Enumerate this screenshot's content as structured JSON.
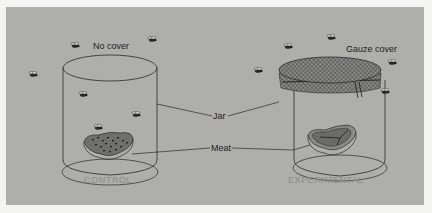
{
  "figure": {
    "background_color": "#aeaeab",
    "border_color": "#f4f4f2",
    "line_color": "#2a2a2a"
  },
  "left_jar": {
    "cover_label": "No cover",
    "caption": "CONTROL",
    "meat_state": "maggots"
  },
  "right_jar": {
    "cover_label": "Gauze cover",
    "caption": "EXPERIMENTAL",
    "meat_state": "clean"
  },
  "callouts": {
    "jar": "Jar",
    "meat": "Meat"
  },
  "icons": {
    "fly": "fly-icon"
  },
  "caption_color": "#8c8c89"
}
